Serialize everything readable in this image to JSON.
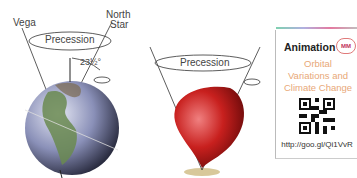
{
  "earth_diagram": {
    "star_left_label": "Vega",
    "star_right_label_line1": "North",
    "star_right_label_line2": "Star",
    "precession_label": "Precession",
    "tilt_angle_label": "23½°"
  },
  "top_diagram": {
    "precession_label": "Precession",
    "top_color": "#c8201e"
  },
  "animation_card": {
    "title": "Animation",
    "badge": "MM",
    "subtitle_line1": "Orbital",
    "subtitle_line2": "Variations and",
    "subtitle_line3": "Climate Change",
    "url": "http://goo.gl/Qi1VvR",
    "accent_color": "#e8a878"
  }
}
